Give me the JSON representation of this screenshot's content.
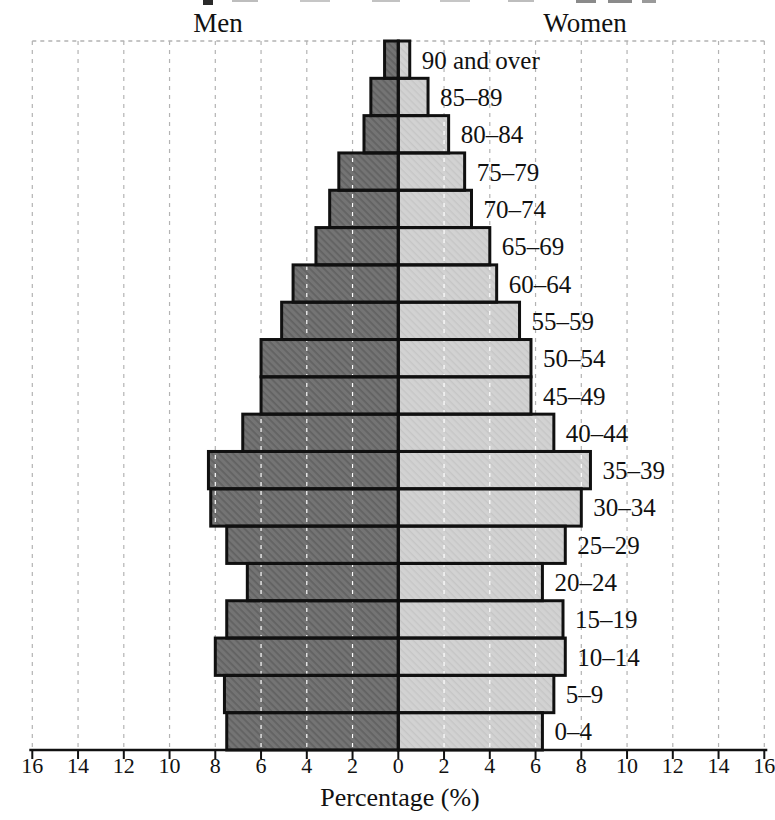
{
  "header": {
    "left_side_label": "Men",
    "right_side_label": "Women"
  },
  "chart_data": {
    "type": "bar",
    "subtype": "population-pyramid",
    "orientation": "horizontal-mirrored",
    "row_order": "top-to-bottom",
    "categories": [
      "90 and over",
      "85–89",
      "80–84",
      "75–79",
      "70–74",
      "65–69",
      "60–64",
      "55–59",
      "50–54",
      "45–49",
      "40–44",
      "35–39",
      "30–34",
      "25–29",
      "20–24",
      "15–19",
      "10–14",
      "5–9",
      "0–4"
    ],
    "series": [
      {
        "name": "Men",
        "side": "left",
        "values": [
          0.6,
          1.2,
          1.5,
          2.6,
          3.0,
          3.6,
          4.6,
          5.1,
          6.0,
          6.0,
          6.8,
          8.3,
          8.2,
          7.5,
          6.6,
          7.5,
          8.0,
          7.6,
          7.5
        ]
      },
      {
        "name": "Women",
        "side": "right",
        "values": [
          0.5,
          1.3,
          2.2,
          2.9,
          3.2,
          4.0,
          4.3,
          5.3,
          5.8,
          5.8,
          6.8,
          8.4,
          8.0,
          7.3,
          6.3,
          7.2,
          7.3,
          6.8,
          6.3
        ]
      }
    ],
    "xlabel": "Percentage (%)",
    "x_tick_labels": [
      "16",
      "14",
      "12",
      "10",
      "8",
      "6",
      "4",
      "2",
      "0",
      "2",
      "4",
      "6",
      "8",
      "10",
      "12",
      "14",
      "16"
    ],
    "xlim_each_side": 16,
    "grid": {
      "visible": true,
      "style": "dashed-vertical",
      "interval_percent": 2,
      "legend_position": "none"
    },
    "colors": {
      "men_fill": "#747474",
      "men_hatch": "#626262",
      "women_fill": "#d2d2d2",
      "women_hatch": "#c6c6c6",
      "bar_border": "#101010",
      "grid_on_background": "#b3b3b3",
      "grid_on_bars": "#ffffff",
      "axis": "#111111"
    }
  }
}
